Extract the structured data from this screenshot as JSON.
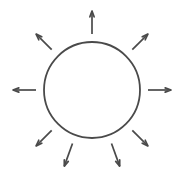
{
  "canvas": {
    "width": 184,
    "height": 183,
    "background_color": "#ffffff"
  },
  "diagram": {
    "stroke_color": "#4a4a4a",
    "circle": {
      "center_x": 92,
      "center_y": 90,
      "radius": 48,
      "stroke_width": 1.8,
      "fill": "none"
    },
    "arrow_defaults": {
      "stroke_width": 1.7,
      "head_length": 6.2,
      "head_half_angle_deg": 20,
      "inner_gap": 8,
      "length": 22
    },
    "arrows": [
      {
        "name": "arrow-up",
        "angle_deg": 90,
        "inner_gap": 8,
        "length": 23,
        "direction": "outward"
      },
      {
        "name": "arrow-up-right",
        "angle_deg": 45,
        "inner_gap": 9,
        "length": 22,
        "direction": "outward"
      },
      {
        "name": "arrow-right",
        "angle_deg": 0,
        "inner_gap": 8,
        "length": 23,
        "direction": "outward"
      },
      {
        "name": "arrow-down-right",
        "angle_deg": -45,
        "inner_gap": 9,
        "length": 22,
        "direction": "outward"
      },
      {
        "name": "arrow-down-right-steep",
        "angle_deg": -70,
        "inner_gap": 9,
        "length": 24,
        "direction": "outward"
      },
      {
        "name": "arrow-down-left-steep",
        "angle_deg": -110,
        "inner_gap": 9,
        "length": 24,
        "direction": "outward"
      },
      {
        "name": "arrow-down-left",
        "angle_deg": -135,
        "inner_gap": 9,
        "length": 22,
        "direction": "outward"
      },
      {
        "name": "arrow-left",
        "angle_deg": 180,
        "inner_gap": 8,
        "length": 23,
        "direction": "outward"
      },
      {
        "name": "arrow-up-left",
        "angle_deg": 135,
        "inner_gap": 9,
        "length": 22,
        "direction": "outward"
      }
    ]
  }
}
